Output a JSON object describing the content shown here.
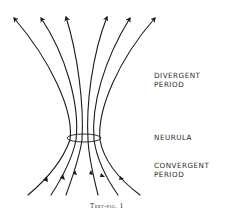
{
  "figure": {
    "caption": "Text-fig. 1",
    "labels": {
      "divergent": "DIVERGENT\nPERIOD",
      "neurula": "NEURULA",
      "convergent": "CONVERGENT\nPERIOD"
    },
    "line_count": 6,
    "ring": {
      "cx": 84,
      "cy": 138,
      "rx": 17,
      "ry": 4
    },
    "colors": {
      "stroke": "#1a1a1a",
      "text": "#2a2a2a",
      "background": "#ffffff"
    }
  }
}
